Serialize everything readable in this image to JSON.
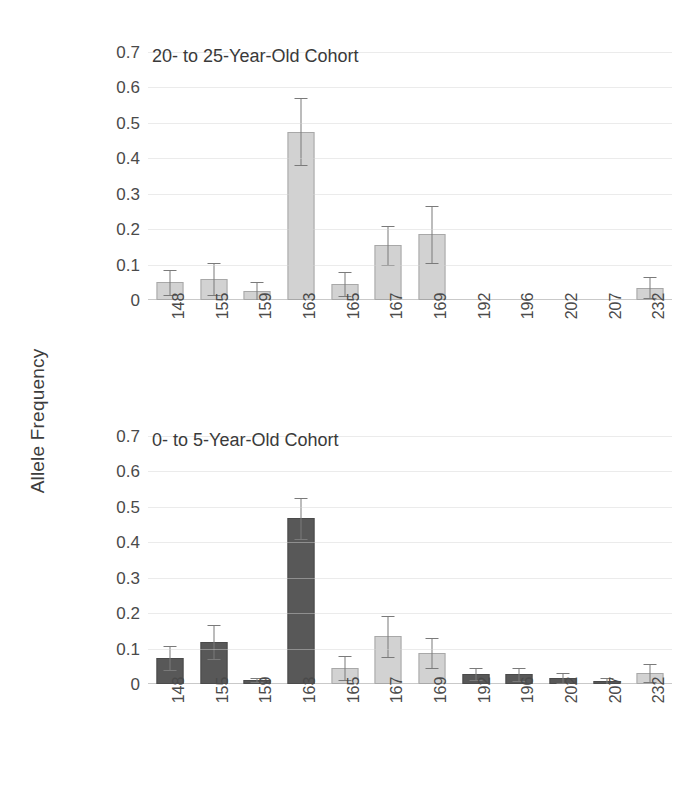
{
  "figure": {
    "ylabel": "Allele Frequency"
  },
  "chart_data": [
    {
      "type": "bar",
      "title": "20- to 25-Year-Old Cohort",
      "xlabel": "",
      "ylabel": "Allele Frequency",
      "ylim": [
        0,
        0.7
      ],
      "yticks": [
        "0.7",
        "0.6",
        "0.5",
        "0.4",
        "0.3",
        "0.2",
        "0.1",
        "0"
      ],
      "ytick_values": [
        0.7,
        0.6,
        0.5,
        0.4,
        0.3,
        0.2,
        0.1,
        0
      ],
      "grid": true,
      "legend": "none",
      "categories": [
        "148",
        "155",
        "159",
        "163",
        "165",
        "167",
        "169",
        "192",
        "196",
        "202",
        "207",
        "232"
      ],
      "values": [
        0.05,
        0.06,
        0.025,
        0.475,
        0.045,
        0.155,
        0.185,
        0,
        0,
        0,
        0,
        0.035
      ],
      "errors": [
        0.035,
        0.045,
        0.025,
        0.095,
        0.035,
        0.055,
        0.08,
        0,
        0,
        0,
        0,
        0.03
      ],
      "bar_shades": [
        "light",
        "light",
        "light",
        "light",
        "light",
        "light",
        "light",
        "none",
        "none",
        "none",
        "none",
        "light"
      ]
    },
    {
      "type": "bar",
      "title": "0- to 5-Year-Old Cohort",
      "xlabel": "",
      "ylabel": "Allele Frequency",
      "ylim": [
        0,
        0.7
      ],
      "yticks": [
        "0.7",
        "0.6",
        "0.5",
        "0.4",
        "0.3",
        "0.2",
        "0.1",
        "0"
      ],
      "ytick_values": [
        0.7,
        0.6,
        0.5,
        0.4,
        0.3,
        0.2,
        0.1,
        0
      ],
      "grid": true,
      "legend": "none",
      "categories": [
        "148",
        "155",
        "159",
        "163",
        "165",
        "167",
        "169",
        "192",
        "196",
        "202",
        "207",
        "232"
      ],
      "values": [
        0.073,
        0.118,
        0.012,
        0.468,
        0.045,
        0.135,
        0.088,
        0.028,
        0.027,
        0.017,
        0.009,
        0.031
      ],
      "errors": [
        0.033,
        0.048,
        0.006,
        0.058,
        0.035,
        0.058,
        0.042,
        0.018,
        0.018,
        0.013,
        0.009,
        0.026
      ],
      "bar_shades": [
        "dark",
        "dark",
        "dark",
        "dark",
        "light",
        "light",
        "light",
        "dark",
        "dark",
        "dark",
        "dark",
        "light"
      ]
    }
  ]
}
